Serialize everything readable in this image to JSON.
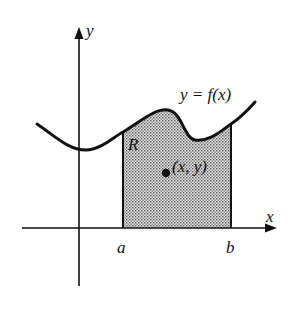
{
  "diagram": {
    "labels": {
      "y_axis": "y",
      "x_axis": "x",
      "curve": "y = f(x)",
      "region": "R",
      "point": "(x, y)",
      "a": "a",
      "b": "b"
    },
    "colors": {
      "ink": "#111111",
      "shade": "#bdbdbd",
      "background": "#ffffff"
    }
  }
}
